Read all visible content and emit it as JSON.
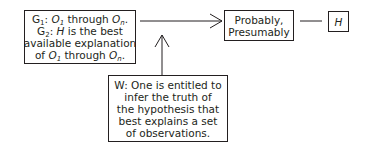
{
  "diagram": {
    "grounds_box": {
      "g1_label": "G",
      "g1_sub": "1",
      "g1_sep": ": ",
      "g1_o_start": "O",
      "g1_o_start_sub": "1",
      "g1_through": " through ",
      "g1_o_end": "O",
      "g1_o_end_sub": "n",
      "g1_end": ".",
      "g2_label": "G",
      "g2_sub": "2",
      "g2_sep": ": ",
      "g2_h": "H",
      "g2_text": " is the best",
      "line3": "available explanation",
      "line4_of": "of ",
      "line4_o_start": "O",
      "line4_o_start_sub": "1",
      "line4_through": " through ",
      "line4_o_end": "O",
      "line4_o_end_sub": "n",
      "line4_end": "."
    },
    "qualifier_box": {
      "line1": "Probably,",
      "line2": "Presumably"
    },
    "claim_box": {
      "label": "H"
    },
    "warrant_box": {
      "lines": [
        "W: One is entitled to",
        "infer the truth of",
        "the hypothesis that",
        "best explains a set",
        "of observations."
      ]
    },
    "colors": {
      "stroke": "#231f20",
      "background": "#ffffff"
    }
  }
}
